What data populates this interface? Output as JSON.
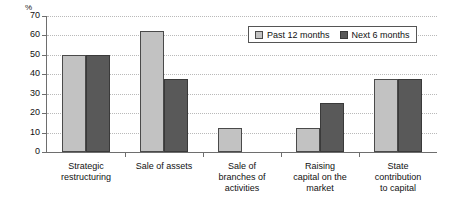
{
  "chart_data": {
    "type": "bar",
    "title": "",
    "subtitle": "",
    "xlabel": "",
    "ylabel": "%",
    "unit_label": "%",
    "ylim": [
      0,
      70
    ],
    "ytick_step": 10,
    "yticks": [
      70,
      60,
      50,
      40,
      30,
      20,
      10,
      0
    ],
    "ytick_labels": [
      "70",
      "60",
      "50",
      "40",
      "30",
      "20",
      "10",
      "0"
    ],
    "grid": true,
    "grid_axis": "y",
    "grid_style": "dotted",
    "legend_position": "top-right",
    "categories": [
      "Strategic restructuring",
      "Sale of assets",
      "Sale of branches of activities",
      "Raising capital on the market",
      "State contribution to capital"
    ],
    "category_lines": [
      [
        "Strategic",
        "restructuring"
      ],
      [
        "Sale of assets"
      ],
      [
        "Sale of",
        "branches of",
        "activities"
      ],
      [
        "Raising",
        "capital on the",
        "market"
      ],
      [
        "State",
        "contribution",
        "to capital"
      ]
    ],
    "series": [
      {
        "name": "Past 12 months",
        "color": "#c2c2c2",
        "values": [
          50,
          62.5,
          12.5,
          12.5,
          37.5
        ]
      },
      {
        "name": "Next 6 months",
        "color": "#595959",
        "values": [
          50,
          37.5,
          0,
          25,
          37.5
        ]
      }
    ]
  },
  "legend": {
    "items": [
      {
        "label": "Past 12 months",
        "swatch": "past"
      },
      {
        "label": "Next 6 months",
        "swatch": "next"
      }
    ]
  },
  "colors": {
    "past_series": "#c2c2c2",
    "next_series": "#595959",
    "axis": "#6e6e6e",
    "gridline": "#b9b9b9",
    "text": "#111111",
    "background": "#ffffff"
  }
}
